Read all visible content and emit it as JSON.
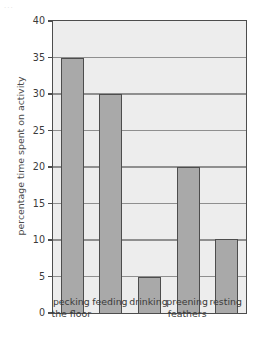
{
  "corner_mark": "...",
  "chart_data": {
    "type": "bar",
    "title": "",
    "xlabel": "",
    "ylabel": "percentage time spent on activity",
    "ylim": [
      0,
      40
    ],
    "ytick_interval": 5,
    "yticks": [
      0,
      5,
      10,
      15,
      20,
      25,
      30,
      35,
      40
    ],
    "ytick_labels": [
      "0",
      "5",
      "10",
      "15",
      "20",
      "25",
      "30",
      "35",
      "40"
    ],
    "grid": "horizontal",
    "legend": "none",
    "categories": [
      "pecking the floor",
      "feeding",
      "drinking",
      "preening feathers",
      "resting"
    ],
    "category_lines": [
      [
        "pecking",
        "the floor"
      ],
      [
        "feeding"
      ],
      [
        "drinking"
      ],
      [
        "preening",
        "feathers"
      ],
      [
        "resting"
      ]
    ],
    "values": [
      35,
      30,
      5,
      20,
      10.2
    ],
    "bar_color": "#a9a9a9",
    "bar_edge_color": "#4d4d4d",
    "plot_background": "#ededed",
    "gridline_color": "#8f8f8f",
    "axis_color": "#4d4d4d"
  }
}
